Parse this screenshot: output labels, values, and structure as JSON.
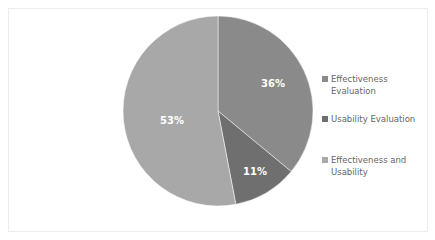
{
  "chart_data": {
    "type": "pie",
    "title": "",
    "categories": [
      "Effectiveness Evaluation",
      "Usability Evaluation",
      "Effectiveness and Usability"
    ],
    "values": [
      36,
      11,
      53
    ],
    "labels": [
      "36%",
      "11%",
      "53%"
    ],
    "colors": [
      "#8a8a8a",
      "#6f6f6f",
      "#a8a8a8"
    ],
    "start_angle": "12 o'clock",
    "direction": "clockwise",
    "legend_position": "right"
  },
  "legend": {
    "items": [
      {
        "label": "Effectiveness Evaluation",
        "color": "#8a8a8a"
      },
      {
        "label": "Usability Evaluation",
        "color": "#6f6f6f"
      },
      {
        "label": "Effectiveness and Usability",
        "color": "#a8a8a8"
      }
    ]
  },
  "slice_labels": {
    "effectiveness": "36%",
    "usability": "11%",
    "both": "53%"
  }
}
